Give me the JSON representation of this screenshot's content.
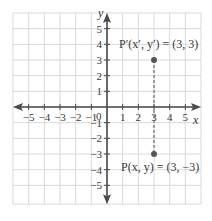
{
  "diagram": {
    "type": "coordinate-plane",
    "x_axis_label": "x",
    "y_axis_label": "y",
    "x_range": [
      -5,
      5
    ],
    "y_range": [
      -5,
      5
    ],
    "x_ticks": [
      "−5",
      "−4",
      "−3",
      "−2",
      "−1",
      "1",
      "2",
      "3",
      "4",
      "5"
    ],
    "y_ticks": [
      "5",
      "4",
      "3",
      "2",
      "1",
      "−1",
      "−2",
      "−3",
      "−4",
      "−5"
    ],
    "origin_label": "0",
    "points": [
      {
        "name": "P-prime",
        "x": 3,
        "y": 3,
        "label": "P′(x′, y′) = (3, 3)"
      },
      {
        "name": "P",
        "x": 3,
        "y": -3,
        "label": "P(x, y) = (3, −3)"
      }
    ],
    "dashed_segment": {
      "from": [
        3,
        3
      ],
      "to": [
        3,
        -3
      ]
    },
    "colors": {
      "grid": "#d9d9d9",
      "axis": "#4a4a4a",
      "point": "#555555",
      "text": "#3a3a3a"
    }
  }
}
